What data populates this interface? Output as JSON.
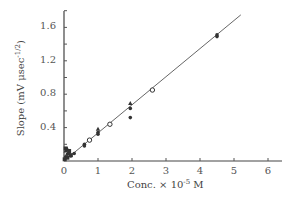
{
  "chart_data": {
    "type": "scatter",
    "title": "",
    "xlabel": "Conc. × 10^-5 M",
    "xlabel_base": "Conc. × 10",
    "xlabel_exp": "-5",
    "xlabel_unit": " M",
    "ylabel": "Slope (mV μsec^-1/2)",
    "ylabel_base": "Slope  (mV μsec",
    "ylabel_exp": "-1/2",
    "ylabel_close": ")",
    "xlim": [
      0,
      6.3
    ],
    "ylim": [
      0,
      1.8
    ],
    "xticks": [
      "0",
      "1",
      "2",
      "3",
      "4",
      "5",
      "6"
    ],
    "yticks": [
      "0.4",
      "0.8",
      "1.2",
      "1.6"
    ],
    "grid": false,
    "legend": "none",
    "fit_line": {
      "x": [
        0,
        5.2
      ],
      "y": [
        0,
        1.75
      ]
    },
    "series": [
      {
        "name": "filled circles",
        "marker": "circle-filled",
        "x": [
          0.05,
          0.1,
          0.15,
          0.2,
          0.3,
          0.6,
          0.6,
          1.0,
          1.0,
          1.95,
          1.95,
          4.5,
          4.5
        ],
        "y": [
          0.05,
          0.08,
          0.1,
          0.06,
          0.09,
          0.2,
          0.18,
          0.34,
          0.32,
          0.63,
          0.52,
          1.51,
          1.49
        ]
      },
      {
        "name": "triangles",
        "marker": "triangle-filled",
        "x": [
          0.05,
          0.1,
          1.0,
          1.95
        ],
        "y": [
          0.12,
          0.14,
          0.38,
          0.69
        ]
      },
      {
        "name": "filled squares",
        "marker": "square-filled",
        "x": [
          0.02,
          0.05,
          0.1,
          0.15,
          0.2
        ],
        "y": [
          0.02,
          0.15,
          0.04,
          0.12,
          0.07
        ]
      },
      {
        "name": "open circles",
        "marker": "circle-open",
        "x": [
          0.75,
          1.35,
          2.6
        ],
        "y": [
          0.25,
          0.44,
          0.85
        ]
      }
    ]
  }
}
